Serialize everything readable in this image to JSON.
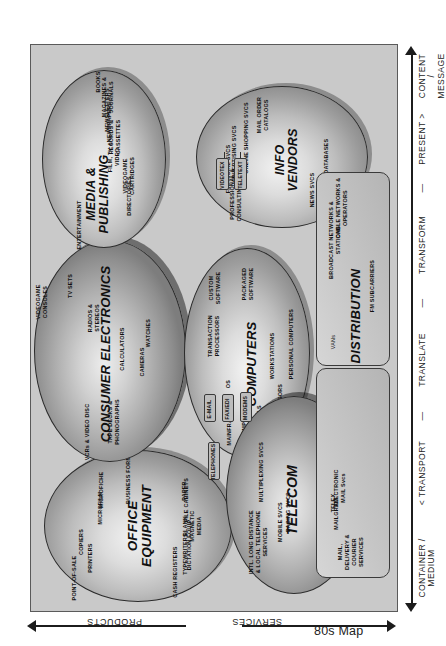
{
  "title": "80s Map",
  "axes": {
    "bottom": {
      "labels": [
        "CONTAINER /\nMEDIUM",
        "< TRANSPORT",
        "—",
        "TRANSLATE",
        "—",
        "TRANSFORM",
        "—",
        "PRESENT >",
        "CONTENT /\nMESSAGE"
      ]
    },
    "left": {
      "top_label": "PRODUCTS",
      "bottom_label": "SERVICES"
    }
  },
  "nodes": [
    {
      "id": "office-equipment",
      "title": "OFFICE\nEQUIPMENT",
      "shape": "ellipse",
      "items": [
        "POINT-OF-SALE",
        "CASH REGISTERS",
        "TYPEWRITERS",
        "DICTATION EQUIP",
        "BLANK\nMAGNETIC\nMEDIA",
        "FILE CABINETS",
        "PAPER",
        "PRINTERS",
        "COPIERS",
        "MICROFILM",
        "MICROFICHE",
        "BUSINESS FORMS"
      ]
    },
    {
      "id": "consumer-electronics",
      "title": "CONSUMER ELECTRONICS",
      "shape": "ellipse",
      "items": [
        "VCRs & VIDEO DISC",
        "TAPE DECKS &\nPHONOGRAPHS",
        "CAMERAS",
        "WATCHES",
        "CALCULATORS",
        "RADIOS &\nSTEREOS",
        "TV SETS",
        "VIDEOGAME\nCONSOLES"
      ]
    },
    {
      "id": "computers",
      "title": "COMPUTERS",
      "shape": "ellipse",
      "items": [
        "MAINFRAMES",
        "MINICOMPUTERS",
        "TERMINALS",
        "WORD PROCESSORS",
        "WORKSTATIONS",
        "PERSONAL COMPUTERS",
        "OS",
        "TRANSACTION\nPROCESSORS",
        "CUSTOM\nSOFTWARE",
        "PACKAGED\nSOFTWARE"
      ]
    },
    {
      "id": "telecom",
      "title": "TELECOM",
      "shape": "ellipse",
      "items": [
        "INTL. LONG DISTANCE\n& LOCAL TELEPHONE\nSERVICES",
        "MOBILE SVCS",
        "PAGING SVCS",
        "MULTIPLEXING SVCS",
        "TELEPHONE\nSWITCHING EQUIP"
      ]
    },
    {
      "id": "media-publishing",
      "title": "MEDIA &\nPUBLISHING",
      "shape": "ellipse",
      "items": [
        "ENTERTAINMENT",
        "DIRECTORIES",
        "VIDEOGAME\nCARTRIDGES",
        "FILM, TV &\nVIDEO",
        "RECORDS &\nCASSETTES",
        "NEWSPAPERS",
        "NEWSLETTERS",
        "MAGAZINES &\nJOURNALS",
        "BOOKS"
      ]
    },
    {
      "id": "info-vendors",
      "title": "INFO\nVENDORS",
      "shape": "ellipse",
      "items": [
        "PROFESSIONAL &\nCONSULTING SVCS",
        "FINANCIAL SVCS",
        "ADVERTISING SVCS",
        "ONLINE SHOPPING SVCS",
        "MAIL ORDER\nCATALOGS",
        "NEWS SVCS",
        "ONLINE DATABASES"
      ]
    },
    {
      "id": "distribution",
      "title": "DISTRIBUTION",
      "shape": "rounded-rect",
      "items": [
        "VANs",
        "FM SUBCARRIERS",
        "BROADCAST NETWORKS &\nSTATIONS",
        "CABLE  NETWORKS &\nOPERATORS"
      ]
    },
    {
      "id": "mail",
      "title": "MAIL,\nDELIVERY &\nCOURIER\nSERVICES",
      "shape": "rounded-rect",
      "items": [
        "MAILGRAM",
        "TELEX",
        "ELECTRONIC\nMAIL Svcs"
      ]
    }
  ],
  "connectors": [
    "VIDEOTEX",
    "TELETEXT",
    "E-MAIL",
    "FAX/EDI",
    "MODEMS",
    "TELEPHONES"
  ],
  "colors": {
    "background": "#ffffff",
    "panel": "#c9c9c9",
    "outline": "#2b2b2b",
    "text": "#111111"
  }
}
